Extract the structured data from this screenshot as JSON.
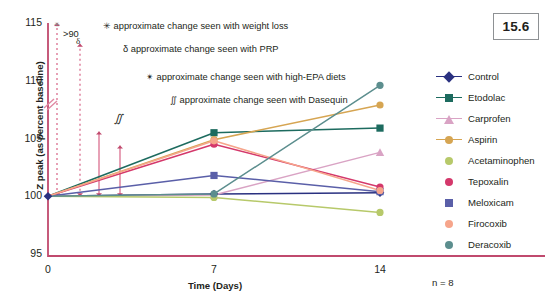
{
  "figure": {
    "number": "15.6"
  },
  "axes": {
    "ylabel": "Z peak (as percent baseline)",
    "xlabel": "Time (Days)",
    "yticks": [
      "115",
      "110",
      "105",
      "100",
      "95"
    ],
    "xticks": [
      "0",
      "7",
      "14"
    ]
  },
  "footnote": {
    "n": "n = 8"
  },
  "annotations": [
    {
      "symbol": "✳",
      "text": "approximate change seen with weight loss"
    },
    {
      "symbol": "δ",
      "text": "approximate change seen with PRP"
    },
    {
      "symbol": "✴",
      "text": "approximate change seen with high-EPA diets"
    },
    {
      "symbol": "∬",
      "text": "approximate change seen with Dasequin"
    }
  ],
  "annotation_markers": [
    {
      "label": ">90",
      "symbol": "✳",
      "style": "dashed",
      "top_value": 115.0,
      "bottom_value": 100.0
    },
    {
      "label": "",
      "symbol": "δ",
      "style": "dashed",
      "top_value": 113.2,
      "bottom_value": 100.0
    },
    {
      "label": "",
      "symbol": "✴",
      "style": "solid",
      "top_value": 105.6,
      "bottom_value": 100.0
    },
    {
      "label": "∬",
      "symbol": "∬",
      "style": "solid",
      "top_value": 104.4,
      "bottom_value": 100.0
    }
  ],
  "axis_break": {
    "symbol": "⫻",
    "value": 108.5
  },
  "legend": {
    "items": [
      {
        "label": "Control",
        "color": "#2a3180",
        "marker": "diamond",
        "line": true
      },
      {
        "label": "Etodolac",
        "color": "#1d6b5f",
        "marker": "square",
        "line": true
      },
      {
        "label": "Carprofen",
        "color": "#d9a3c4",
        "marker": "tri",
        "line": true
      },
      {
        "label": "Aspirin",
        "color": "#d6a552",
        "marker": "circle",
        "line": true
      },
      {
        "label": "Acetaminophen",
        "color": "#b7c96a",
        "marker": "circle",
        "line": false
      },
      {
        "label": "Tepoxalin",
        "color": "#d4386b",
        "marker": "circle",
        "line": false
      },
      {
        "label": "Meloxicam",
        "color": "#5a5fa8",
        "marker": "square",
        "line": false
      },
      {
        "label": "Firocoxib",
        "color": "#f6a58b",
        "marker": "circle",
        "line": false
      },
      {
        "label": "Deracoxib",
        "color": "#5c8e8e",
        "marker": "circle",
        "line": false
      }
    ]
  },
  "colors": {
    "axis": "#c04a6e",
    "text": "#231f20",
    "box_border": "#8e9194",
    "background": "#ffffff"
  },
  "chart_data": {
    "type": "line",
    "title": "",
    "xlabel": "Time (Days)",
    "ylabel": "Z peak (as percent baseline)",
    "x": [
      0,
      7,
      14
    ],
    "xlim": [
      0,
      14
    ],
    "ylim": [
      95,
      115
    ],
    "xticks": [
      0,
      7,
      14
    ],
    "yticks": [
      95,
      100,
      105,
      110,
      115
    ],
    "grid": false,
    "legend_position": "right",
    "n": 8,
    "series": [
      {
        "name": "Control",
        "color": "#2a3180",
        "marker": "diamond",
        "values": [
          100.0,
          100.2,
          100.3
        ]
      },
      {
        "name": "Etodolac",
        "color": "#1d6b5f",
        "marker": "square",
        "values": [
          100.0,
          105.5,
          105.9
        ]
      },
      {
        "name": "Carprofen",
        "color": "#d9a3c4",
        "marker": "triangle",
        "values": [
          100.0,
          100.1,
          103.8
        ]
      },
      {
        "name": "Aspirin",
        "color": "#d6a552",
        "marker": "circle",
        "values": [
          100.0,
          104.9,
          107.9
        ]
      },
      {
        "name": "Acetaminophen",
        "color": "#b7c96a",
        "marker": "circle",
        "values": [
          100.0,
          99.9,
          98.6
        ]
      },
      {
        "name": "Tepoxalin",
        "color": "#d4386b",
        "marker": "circle",
        "values": [
          100.0,
          104.5,
          100.8
        ]
      },
      {
        "name": "Meloxicam",
        "color": "#5a5fa8",
        "marker": "square",
        "values": [
          100.0,
          101.8,
          100.4
        ]
      },
      {
        "name": "Firocoxib",
        "color": "#f6a58b",
        "marker": "circle",
        "values": [
          100.0,
          104.8,
          100.5
        ]
      },
      {
        "name": "Deracoxib",
        "color": "#5c8e8e",
        "marker": "circle",
        "values": [
          100.0,
          100.2,
          109.6
        ]
      }
    ]
  }
}
